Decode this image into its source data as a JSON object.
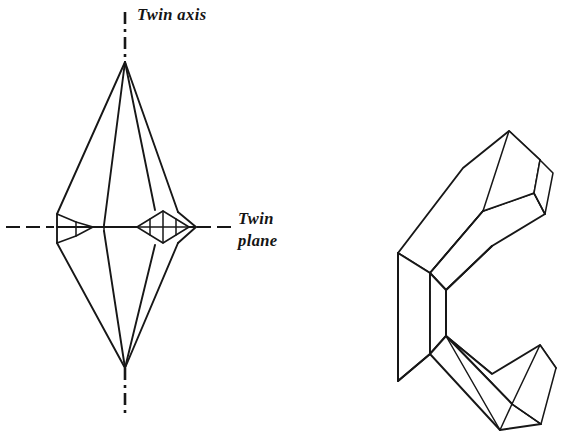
{
  "figure": {
    "background_color": "#ffffff",
    "ink_color": "#171717",
    "labels": {
      "twin_axis": "Twin axis",
      "twin_plane_line1": "Twin",
      "twin_plane_line2": "plane"
    },
    "left_crystal": {
      "name": "bipyramidal twinned crystal (front view)",
      "apex_top": [
        125,
        62
      ],
      "apex_bottom": [
        125,
        368
      ],
      "waist_y": 227,
      "waist_left_x": 55,
      "waist_right_x": 196
    },
    "right_crystal": {
      "name": "elbow-shaped twinned crystal (perspective view)",
      "arms": [
        "upper-right arm",
        "lower-right arm",
        "left vertical body"
      ]
    },
    "axis": {
      "name": "twin axis",
      "style": "dash-dot vertical",
      "x": 125,
      "top_y": 12,
      "bottom_y": 418
    },
    "plane": {
      "name": "twin plane",
      "style": "dashed horizontal",
      "y": 227,
      "left_x": 6,
      "right_x": 232
    }
  }
}
